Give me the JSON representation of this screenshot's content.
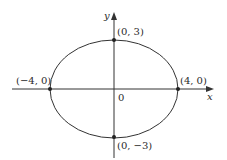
{
  "diagram": {
    "type": "ellipse-on-axes",
    "equation_implied": "x^2/16 + y^2/9 = 1",
    "axes": {
      "x_label": "x",
      "y_label": "y",
      "origin_label": "0"
    },
    "ellipse": {
      "center": [
        0,
        0
      ],
      "semi_major_x": 4,
      "semi_minor_y": 3
    },
    "points": [
      {
        "id": "top",
        "label": "(0, 3)",
        "coords": [
          0,
          3
        ]
      },
      {
        "id": "left",
        "label": "(−4, 0)",
        "coords": [
          -4,
          0
        ]
      },
      {
        "id": "right",
        "label": "(4, 0)",
        "coords": [
          4,
          0
        ]
      },
      {
        "id": "bottom",
        "label": "(0, −3)",
        "coords": [
          0,
          -3
        ]
      }
    ],
    "colors": {
      "stroke": "#333333",
      "text": "#2a2a2a",
      "background": "#ffffff"
    }
  }
}
